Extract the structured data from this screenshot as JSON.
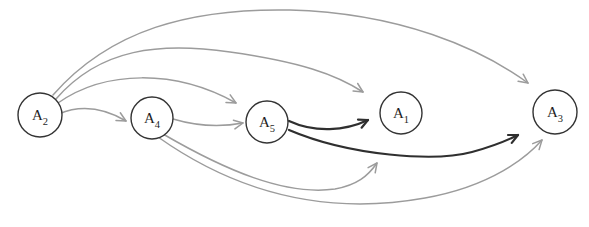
{
  "figure": {
    "type": "directed-graph",
    "canvas": {
      "width": 589,
      "height": 227,
      "background": "#ffffff"
    },
    "colors": {
      "gray": "#9c9c9c",
      "black": "#2f2f2f",
      "node_stroke": "#343434",
      "node_fill": "#ffffff",
      "label": "#1f1f1f"
    },
    "arrowhead": {
      "length": 10,
      "angle_deg": 26
    },
    "node_style": {
      "stroke_width": 1.4,
      "label_size": 15,
      "subscript_size": 10.5,
      "subscript_dy": 4.5
    },
    "nodes": [
      {
        "id": "A2",
        "label": "A",
        "subscript": "2",
        "x": 40,
        "y": 115,
        "r": 22
      },
      {
        "id": "A4",
        "label": "A",
        "subscript": "4",
        "x": 152,
        "y": 118,
        "r": 21
      },
      {
        "id": "A5",
        "label": "A",
        "subscript": "5",
        "x": 267,
        "y": 122,
        "r": 21
      },
      {
        "id": "A1",
        "label": "A",
        "subscript": "1",
        "x": 401,
        "y": 113,
        "r": 21
      },
      {
        "id": "A3",
        "label": "A",
        "subscript": "3",
        "x": 555,
        "y": 112,
        "r": 22
      }
    ],
    "edges": [
      {
        "from": "A2",
        "to": "A4",
        "color": "gray",
        "width": 1.5,
        "path": "M 59,114 C 80,105 102,107 126,121"
      },
      {
        "from": "A2",
        "to": "A5",
        "color": "gray",
        "width": 1.5,
        "path": "M 58,103 C 105,70 175,69 236,103"
      },
      {
        "from": "A2",
        "to": "A1",
        "color": "gray",
        "width": 1.5,
        "path": "M 56,99 C 100,48 160,42 230,52 C 300,62 335,74 363,92"
      },
      {
        "from": "A2",
        "to": "A3",
        "color": "gray",
        "width": 1.5,
        "path": "M 53,95 C 110,30 190,8 290,10 C 400,13 480,48 528,83"
      },
      {
        "from": "A4",
        "to": "A5",
        "color": "gray",
        "width": 1.5,
        "path": "M 173,119 C 200,127 222,127 243,123"
      },
      {
        "from": "A4",
        "to": "A1",
        "color": "gray",
        "width": 1.5,
        "path": "M 163,134 C 225,170 285,196 335,189 C 357,185 368,176 377,163"
      },
      {
        "from": "A4",
        "to": "A3",
        "color": "gray",
        "width": 1.5,
        "path": "M 158,137 C 240,195 330,215 425,198 C 492,186 527,157 542,140"
      },
      {
        "from": "A5",
        "to": "A1",
        "color": "black",
        "width": 2.2,
        "path": "M 289,121 C 315,133 345,131 368,120"
      },
      {
        "from": "A5",
        "to": "A3",
        "color": "black",
        "width": 2.2,
        "path": "M 289,130 C 350,156 435,162 472,152 C 494,146 506,141 518,135"
      }
    ]
  }
}
